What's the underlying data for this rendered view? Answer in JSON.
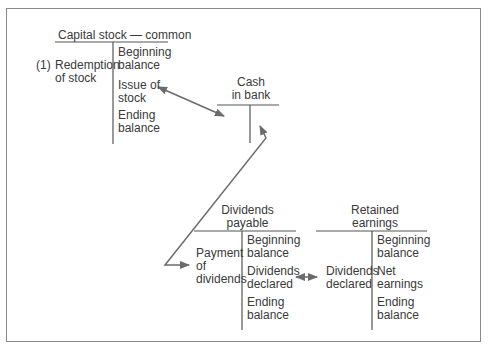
{
  "accounts": {
    "capital_stock": {
      "title": "Capital stock — common",
      "debit_marker": "(1)",
      "debit": [
        "Redemption\nof stock"
      ],
      "credit": [
        "Beginning\nbalance",
        "Issue of\nstock",
        "Ending\nbalance"
      ]
    },
    "cash": {
      "title": "Cash\nin bank"
    },
    "dividends_payable": {
      "title": "Dividends\npayable",
      "debit": [
        "Payment\nof\ndividends"
      ],
      "credit": [
        "Beginning\nbalance",
        "Dividends\ndeclared",
        "Ending\nbalance"
      ]
    },
    "retained_earnings": {
      "title": "Retained\nearnings",
      "debit": [
        "Dividends\ndeclared"
      ],
      "credit": [
        "Beginning\nbalance",
        "Net\nearnings",
        "Ending\nbalance"
      ]
    }
  },
  "connectors": [
    {
      "from": "capital_stock.issue_of_stock",
      "to": "cash",
      "style": "double-arrow"
    },
    {
      "from": "cash",
      "to": "dividends_payable.payment_of_dividends",
      "style": "double-arrow"
    },
    {
      "from": "dividends_payable.dividends_declared",
      "to": "retained_earnings.dividends_declared",
      "style": "double-arrow"
    }
  ],
  "colors": {
    "line": "#555555",
    "arrow": "#6b6b6b",
    "frame": "#8a8a8a"
  }
}
